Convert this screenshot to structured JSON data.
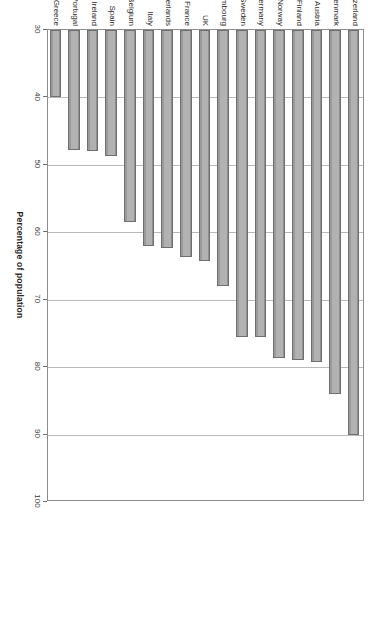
{
  "chart_data": {
    "type": "bar",
    "title": "",
    "subtitle": "",
    "xlabel": "",
    "ylabel": "Percentage of population",
    "ylim": [
      30,
      100
    ],
    "yticks": [
      30,
      40,
      50,
      60,
      70,
      80,
      90,
      100
    ],
    "grid": true,
    "legend": false,
    "orientation": "vertical-rotated",
    "categories": [
      "Switzerland",
      "Denmark",
      "Austria",
      "Finland",
      "Norway",
      "Germany",
      "Sweden",
      "Luxembourg",
      "UK",
      "France",
      "Netherlands",
      "Italy",
      "Belgium",
      "Spain",
      "Ireland",
      "Portugal",
      "Greece"
    ],
    "values": [
      90,
      84,
      79.3,
      79,
      78.7,
      75.5,
      75.5,
      68,
      64.3,
      63.7,
      62.3,
      62,
      58.5,
      48.7,
      48,
      47.8,
      40
    ]
  },
  "style": {
    "bar_fill": "#b2b2b2",
    "bar_border": "#6f6f6f",
    "gridline_color": "#b9b9b9",
    "frame_color": "#8d8d8d",
    "text_color": "#2b2b2b",
    "background": "#ffffff"
  }
}
